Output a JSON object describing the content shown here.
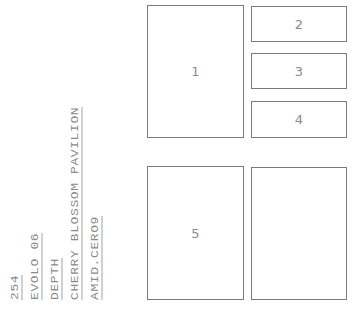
{
  "spine_text": {
    "page_number": "254",
    "magazine": "EVOLO 06",
    "section": "DEPTH",
    "title": "CHERRY BLOSSOM PAVILION",
    "credit": "AMID.CERO9"
  },
  "layout_boxes": [
    {
      "id": "box-1",
      "label": "1"
    },
    {
      "id": "box-2",
      "label": "2"
    },
    {
      "id": "box-3",
      "label": "3"
    },
    {
      "id": "box-4",
      "label": "4"
    },
    {
      "id": "box-5",
      "label": "5"
    },
    {
      "id": "box-6",
      "label": ""
    }
  ],
  "colors": {
    "text": "#8a8a8a",
    "border": "#7a7a7a",
    "background": "#ffffff"
  }
}
